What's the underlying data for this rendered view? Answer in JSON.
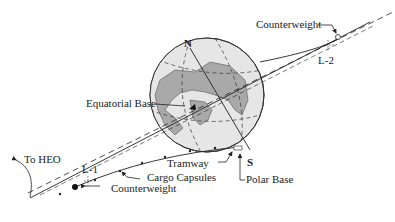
{
  "diagram": {
    "labels": {
      "counterweight_top": "Counterweight",
      "l2": "L-2",
      "north": "N",
      "equatorial_base": "Equatorial Base",
      "to_heo": "To HEO",
      "l1": "L-1",
      "tramway": "Tramway",
      "cargo_capsules": "Cargo Capsules",
      "counterweight_bottom": "Counterweight",
      "south": "S",
      "polar_base": "Polar Base"
    },
    "colors": {
      "ocean": "#e6e6e6",
      "land": "#a9a9a9",
      "shadow": "#5a5a5a",
      "line": "#222222"
    }
  }
}
